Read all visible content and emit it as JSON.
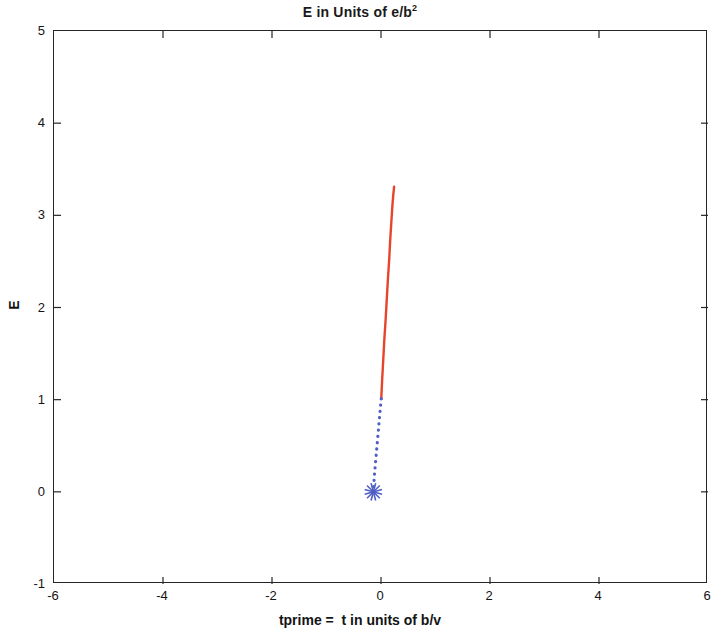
{
  "figure": {
    "background_color": "#ffffff",
    "axes_color": "#262626"
  },
  "chart_data": {
    "type": "line",
    "title": "E in Units of e/b",
    "title_superscript": "2",
    "xlabel": "tprime =  t in units of b/v",
    "ylabel": "E",
    "xlim": [
      -6,
      6
    ],
    "ylim": [
      -1,
      5
    ],
    "xticks": [
      -6,
      -4,
      -2,
      0,
      2,
      4,
      6
    ],
    "xtick_labels": [
      "-6",
      "-4",
      "-2",
      "0",
      "2",
      "4",
      "6"
    ],
    "yticks": [
      -1,
      0,
      1,
      2,
      3,
      4,
      5
    ],
    "ytick_labels": [
      "-1",
      "0",
      "1",
      "2",
      "3",
      "4",
      "5"
    ],
    "grid": false,
    "legend": null,
    "tick_direction": "in",
    "box": true,
    "series": [
      {
        "name": "red-solid-branch",
        "color": "#E8432B",
        "linestyle": "solid",
        "linewidth": 2.4,
        "marker": "none",
        "x": [
          0.005,
          0.02,
          0.04,
          0.06,
          0.085,
          0.105,
          0.125,
          0.15,
          0.17,
          0.19,
          0.21,
          0.225,
          0.24
        ],
        "y": [
          1.01,
          1.2,
          1.42,
          1.64,
          1.87,
          2.08,
          2.29,
          2.52,
          2.74,
          2.93,
          3.11,
          3.22,
          3.31
        ]
      },
      {
        "name": "blue-dotted-branch",
        "color": "#4F5FC4",
        "linestyle": "dotted",
        "linewidth": 2.0,
        "marker": "none",
        "x": [
          0.005,
          -0.01,
          -0.025,
          -0.04,
          -0.055,
          -0.07,
          -0.085,
          -0.1,
          -0.115,
          -0.125,
          -0.135,
          -0.14
        ],
        "y": [
          1.01,
          0.92,
          0.82,
          0.72,
          0.62,
          0.52,
          0.42,
          0.32,
          0.22,
          0.14,
          0.06,
          0.0
        ]
      },
      {
        "name": "origin-star-marker",
        "color": "#4F5FC4",
        "linestyle": "none",
        "marker": "star",
        "markersize": 9,
        "x": [
          -0.14
        ],
        "y": [
          0.0
        ]
      }
    ]
  }
}
